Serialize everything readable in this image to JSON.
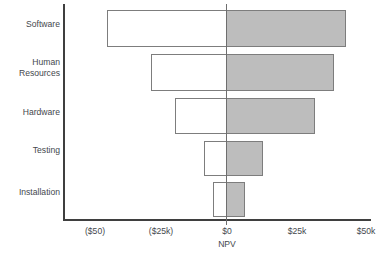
{
  "chart_data": {
    "type": "bar",
    "subtype": "tornado-diagram",
    "title": "",
    "xlabel": "NPV",
    "ylabel": "",
    "grid": false,
    "legend_position": "none",
    "xlim": [
      -50,
      50
    ],
    "xunit": "thousands of dollars",
    "x_tick_labels": [
      "($50)",
      "($25k)",
      "$0",
      "$25k",
      "$50k"
    ],
    "x_tick_values": [
      -50,
      -25,
      0,
      25,
      50
    ],
    "categories": [
      "Software",
      "Human\nResources",
      "Hardware",
      "Testing",
      "Installation"
    ],
    "series": [
      {
        "name": "Low case (unshaded)",
        "values": [
          -43,
          -27,
          -18.7,
          -8,
          -4.7
        ]
      },
      {
        "name": "High case (shaded)",
        "values": [
          43,
          38.5,
          31.7,
          13,
          6.5
        ]
      }
    ],
    "bars": [
      {
        "category": "Software",
        "low": -43,
        "high": 43
      },
      {
        "category": "Human Resources",
        "low": -27,
        "high": 38.5
      },
      {
        "category": "Hardware",
        "low": -18.7,
        "high": 31.7
      },
      {
        "category": "Testing",
        "low": -8,
        "high": 13
      },
      {
        "category": "Installation",
        "low": -4.7,
        "high": 6.5
      }
    ]
  },
  "axes": {
    "x_title": "NPV",
    "ticks": [
      {
        "label": "($50)",
        "value": -50
      },
      {
        "label": "($25k)",
        "value": -25
      },
      {
        "label": "$0",
        "value": 0
      },
      {
        "label": "$25k",
        "value": 25
      },
      {
        "label": "$50k",
        "value": 50
      }
    ]
  },
  "categories": [
    {
      "label": "Software"
    },
    {
      "label": "Human\nResources"
    },
    {
      "label": "Hardware"
    },
    {
      "label": "Testing"
    },
    {
      "label": "Installation"
    }
  ],
  "colors": {
    "bar_high_fill": "#bdbdbd",
    "bar_low_fill": "#ffffff",
    "bar_border": "#7d7d7d",
    "axis": "#3f3f3f",
    "zero_line": "#6e6e6e",
    "text": "#44484d",
    "background": "#ffffff"
  }
}
